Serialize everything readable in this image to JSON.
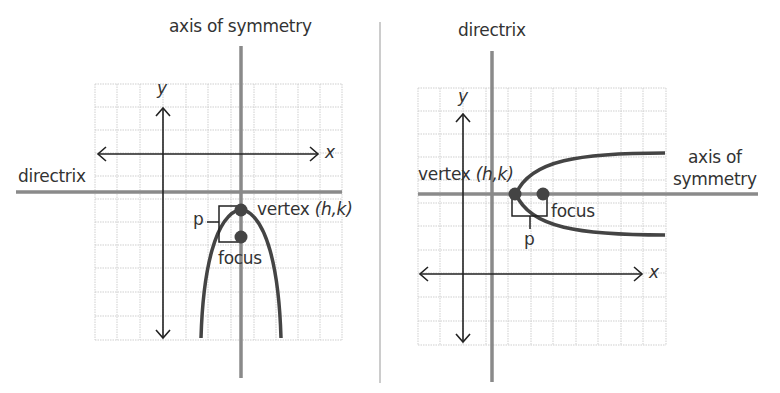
{
  "colors": {
    "grid": "#c8c8c8",
    "axis": "#222222",
    "guide_line": "#8a8a8a",
    "parabola": "#444444",
    "point": "#444444",
    "text": "#333333",
    "divider": "#bbbbbb"
  },
  "left_panel": {
    "title": "Vertical parabola opening downward",
    "labels": {
      "axis_of_symmetry": "axis of symmetry",
      "directrix": "directrix",
      "x_axis": "x",
      "y_axis": "y",
      "vertex": "vertex ",
      "vertex_coords": "(h,k)",
      "focus": "focus",
      "p": "p"
    }
  },
  "right_panel": {
    "title": "Horizontal parabola opening right",
    "labels": {
      "directrix": "directrix",
      "axis_of_symmetry_line1": "axis of",
      "axis_of_symmetry_line2": "symmetry",
      "x_axis": "x",
      "y_axis": "y",
      "vertex": "vertex ",
      "vertex_coords": "(h,k)",
      "focus": "focus",
      "p": "p"
    }
  }
}
